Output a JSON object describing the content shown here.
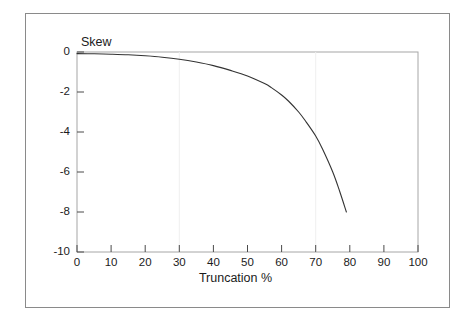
{
  "chart_data": {
    "type": "line",
    "title": "",
    "subtitle": "",
    "xlabel": "Truncation %",
    "ylabel": "Skew",
    "xlim": [
      0,
      100
    ],
    "ylim": [
      -10,
      0
    ],
    "xticks": [
      "0",
      "10",
      "20",
      "30",
      "40",
      "50",
      "60",
      "70",
      "80",
      "90",
      "100"
    ],
    "yticks": [
      "0",
      "-2",
      "-4",
      "-6",
      "-8",
      "-10"
    ],
    "grid": false,
    "legend": null,
    "legend_position": "none",
    "line_color": "#333333",
    "frame_color": "#9a9a9a",
    "background_color": "#ffffff",
    "series": [
      {
        "name": "Skew",
        "x": [
          0,
          5,
          10,
          15,
          20,
          25,
          30,
          35,
          40,
          45,
          50,
          55,
          57,
          60,
          62,
          65,
          67,
          70,
          72,
          75,
          77,
          79
        ],
        "values": [
          -0.08,
          -0.09,
          -0.11,
          -0.14,
          -0.19,
          -0.26,
          -0.36,
          -0.5,
          -0.68,
          -0.92,
          -1.2,
          -1.58,
          -1.78,
          -2.15,
          -2.45,
          -3.0,
          -3.45,
          -4.2,
          -4.85,
          -6.0,
          -6.95,
          -8.0
        ]
      }
    ]
  },
  "axis": {
    "y_label_text": "Skew",
    "x_label_text": "Truncation %",
    "y_tick_0": "0",
    "y_tick_1": "-2",
    "y_tick_2": "-4",
    "y_tick_3": "-6",
    "y_tick_4": "-8",
    "y_tick_5": "-10",
    "x_tick_0": "0",
    "x_tick_1": "10",
    "x_tick_2": "20",
    "x_tick_3": "30",
    "x_tick_4": "40",
    "x_tick_5": "50",
    "x_tick_6": "60",
    "x_tick_7": "70",
    "x_tick_8": "80",
    "x_tick_9": "90",
    "x_tick_10": "100"
  }
}
